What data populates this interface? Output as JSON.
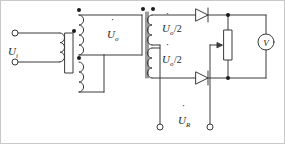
{
  "figure": {
    "type": "schematic",
    "background_color": "#ffffff",
    "line_color": "#3a3a3a",
    "text_color": "#1b1b1b",
    "border": {
      "visible": true,
      "color": "#c8c8c8"
    }
  },
  "labels": {
    "input_voltage": {
      "symbol": "U",
      "dot": "̇",
      "subscript": "i",
      "text": "U̇i"
    },
    "winding_voltage": {
      "symbol": "U",
      "dot": "̇",
      "subscript": "o",
      "text": "U̇o"
    },
    "secondary_upper": {
      "symbol": "U",
      "dot": "̇",
      "subscript": "o",
      "suffix": "/2",
      "text": "U̇o/2"
    },
    "secondary_lower": {
      "symbol": "U",
      "dot": "̇",
      "subscript": "o",
      "suffix": "/2",
      "text": "U̇o/2"
    },
    "output_voltage": {
      "symbol": "U",
      "dot": "̇",
      "subscript": "R",
      "text": "U̇R"
    },
    "voltmeter": {
      "glyph": "V",
      "text": "V"
    }
  },
  "components": [
    {
      "name": "primary-winding",
      "kind": "inductor-coil",
      "turns": 3
    },
    {
      "name": "transformer-core",
      "kind": "core-bar"
    },
    {
      "name": "middle-winding-upper",
      "kind": "inductor-coil",
      "turns": 4
    },
    {
      "name": "middle-winding-lower",
      "kind": "inductor-coil",
      "turns": 3
    },
    {
      "name": "secondary-winding-upper",
      "kind": "inductor-coil",
      "turns": 3
    },
    {
      "name": "secondary-winding-lower",
      "kind": "inductor-coil",
      "turns": 3
    },
    {
      "name": "diode-upper",
      "kind": "diode",
      "orientation": "right"
    },
    {
      "name": "diode-lower",
      "kind": "diode",
      "orientation": "right"
    },
    {
      "name": "potentiometer",
      "kind": "variable-resistor"
    },
    {
      "name": "voltmeter",
      "kind": "meter-circle"
    },
    {
      "name": "input-terminal-top",
      "kind": "open-terminal"
    },
    {
      "name": "input-terminal-bottom",
      "kind": "open-terminal"
    },
    {
      "name": "output-terminal-left",
      "kind": "open-terminal"
    },
    {
      "name": "output-terminal-right",
      "kind": "open-terminal"
    },
    {
      "name": "polarity-dot-primary",
      "kind": "polarity-dot"
    },
    {
      "name": "polarity-dot-middle-top",
      "kind": "polarity-dot"
    },
    {
      "name": "polarity-dot-middle-mid",
      "kind": "polarity-dot"
    },
    {
      "name": "polarity-dot-secondary-a",
      "kind": "polarity-dot"
    },
    {
      "name": "polarity-dot-secondary-b",
      "kind": "polarity-dot"
    },
    {
      "name": "junction-dot-top-right",
      "kind": "junction-dot"
    },
    {
      "name": "junction-dot-bottom-right",
      "kind": "junction-dot"
    }
  ]
}
